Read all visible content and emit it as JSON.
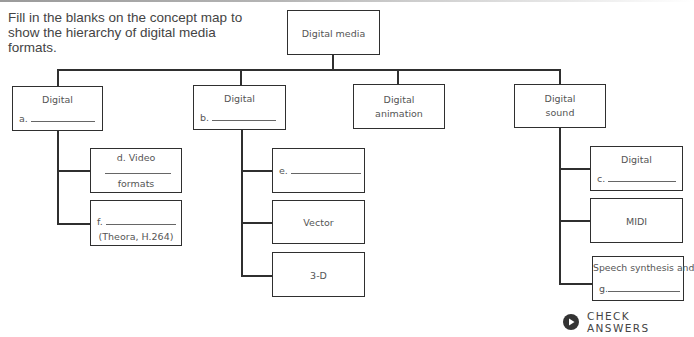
{
  "instructions": "Fill in the blanks on the concept map to show the hierarchy of digital media formats.",
  "root": {
    "label": "Digital media"
  },
  "branches": [
    {
      "title": "Digital",
      "blank_prefix": "a.",
      "children": [
        {
          "line1": "d. Video",
          "line3": "formats"
        },
        {
          "blank_prefix": "f.",
          "caption": "(Theora, H.264)"
        }
      ]
    },
    {
      "title": "Digital",
      "blank_prefix": "b.",
      "children": [
        {
          "blank_prefix": "e."
        },
        {
          "label": "Vector"
        },
        {
          "label": "3-D"
        }
      ]
    },
    {
      "title": "Digital",
      "line2": "animation"
    },
    {
      "title": "Digital",
      "line2": "sound",
      "children": [
        {
          "title": "Digital",
          "blank_prefix": "c."
        },
        {
          "label": "MIDI"
        },
        {
          "title": "Speech synthesis and",
          "blank_prefix": "g."
        }
      ]
    }
  ],
  "check_answers": {
    "label": "CHECK ANSWERS",
    "icon": "play-circle-icon"
  },
  "colors": {
    "line": "#2f2f2f",
    "text": "#555555",
    "icon": "#333333"
  }
}
